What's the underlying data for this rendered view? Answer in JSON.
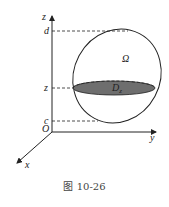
{
  "figure": {
    "caption": "图 10-26",
    "labels": {
      "z_axis": "z",
      "y_axis": "y",
      "x_axis": "x",
      "origin": "O",
      "d": "d",
      "z_level": "z",
      "c": "c",
      "region": "Ω",
      "cross_section": "D",
      "cross_section_sub": "z"
    },
    "colors": {
      "line": "#222222",
      "cross_section_fill": "#6e6e6e"
    }
  }
}
